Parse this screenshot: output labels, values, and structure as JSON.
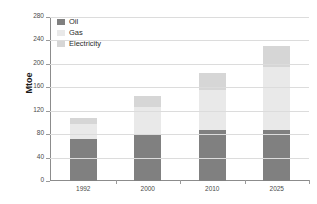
{
  "chart_data": {
    "type": "bar",
    "stacked": true,
    "title": "",
    "xlabel": "",
    "ylabel": "Mtoe",
    "categories": [
      "1992",
      "2000",
      "2010",
      "2025"
    ],
    "series": [
      {
        "name": "Oil",
        "color": "#808080",
        "values": [
          72,
          81,
          87,
          87
        ]
      },
      {
        "name": "Gas",
        "color": "#e9e9e9",
        "values": [
          26,
          45,
          68,
          108
        ]
      },
      {
        "name": "Electricity",
        "color": "#d6d6d6",
        "values": [
          9,
          20,
          29,
          35
        ]
      }
    ],
    "totals": [
      107,
      146,
      184,
      230
    ],
    "ylim": [
      0,
      280
    ],
    "yticks": [
      0,
      40,
      80,
      120,
      160,
      200,
      240,
      280
    ],
    "ytick_labels": [
      "0",
      "40",
      "80",
      "120",
      "160",
      "200",
      "240",
      "280"
    ],
    "grid": true,
    "legend_position": "top-left",
    "legend": [
      "Oil",
      "Gas",
      "Electricity"
    ]
  },
  "colors": {
    "oil": "#808080",
    "gas": "#e9e9e9",
    "electricity": "#d6d6d6",
    "axis": "#8c8c8c",
    "grid": "#dcdcdc",
    "tick_text": "#4a4a4a",
    "label_text": "#1a1a1a",
    "background": "#ffffff"
  }
}
